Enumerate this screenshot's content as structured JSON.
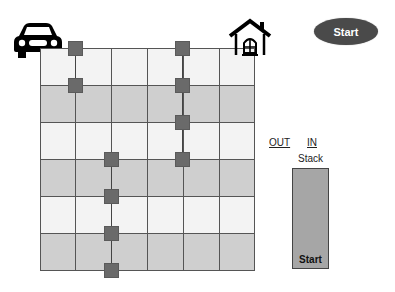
{
  "header": {
    "start_button_label": "Start"
  },
  "icons": {
    "origin": "car-icon",
    "destination": "house-icon"
  },
  "grid": {
    "columns": 6,
    "rows": 6,
    "row_shading": [
      "light",
      "dark",
      "light",
      "dark",
      "light",
      "dark"
    ],
    "nodes": [
      {
        "col": 1,
        "row": 0
      },
      {
        "col": 1,
        "row": 1
      },
      {
        "col": 4,
        "row": 0
      },
      {
        "col": 4,
        "row": 1
      },
      {
        "col": 4,
        "row": 2
      },
      {
        "col": 4,
        "row": 3
      },
      {
        "col": 2,
        "row": 3
      },
      {
        "col": 2,
        "row": 4
      },
      {
        "col": 2,
        "row": 5
      },
      {
        "col": 2,
        "row": 6
      }
    ]
  },
  "stack_panel": {
    "out_label": "OUT",
    "in_label": "IN",
    "title": "Stack",
    "items": [
      "Start"
    ]
  },
  "colors": {
    "node": "#6a6a6a",
    "grid_line": "#555555",
    "row_light": "#f3f3f3",
    "row_dark": "#cfcfcf",
    "stack_fill": "#a6a6a6",
    "start_button": "#4a4a4a"
  }
}
